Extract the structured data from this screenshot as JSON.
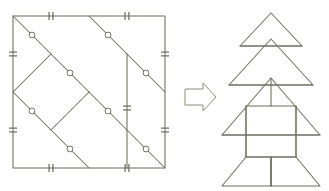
{
  "figure": {
    "caption": "",
    "background_color": "#ffffff",
    "line_color": "#6b6f5e",
    "tick_color": "#5f6353",
    "marker_fill": "#ffffff",
    "arrow_color": "#8a8d7c"
  },
  "left_shape": {
    "name": "square-dissection",
    "label": "",
    "square": {
      "x": 13,
      "y": 16,
      "width": 152,
      "height": 152
    },
    "outline_points": "13,16 165,16 165,168 13,168",
    "cut_lines": [
      {
        "name": "cut-diagonal-upper-left",
        "points": "13,16 89,92"
      },
      {
        "name": "cut-diagonal-upper-right",
        "points": "89,16 165,92"
      },
      {
        "name": "cut-diagonal-lower-left",
        "points": "13,92 89,168"
      },
      {
        "name": "cut-diagonal-lower-right",
        "points": "89,92 165,168"
      },
      {
        "name": "cut-chevron-left",
        "points": "13,92 51,54"
      },
      {
        "name": "cut-chevron-mid",
        "points": "51,130 89,92"
      },
      {
        "name": "cut-vertical-right",
        "points": "127,54 127,168"
      }
    ],
    "nodes": [
      {
        "name": "node-a",
        "x": 32,
        "y": 35
      },
      {
        "name": "node-b",
        "x": 32,
        "y": 111
      },
      {
        "name": "node-c",
        "x": 70,
        "y": 73
      },
      {
        "name": "node-d",
        "x": 70,
        "y": 149
      },
      {
        "name": "node-e",
        "x": 108,
        "y": 35
      },
      {
        "name": "node-f",
        "x": 108,
        "y": 111
      },
      {
        "name": "node-g",
        "x": 146,
        "y": 73
      },
      {
        "name": "node-h",
        "x": 146,
        "y": 149
      }
    ],
    "edge_ticks": [
      {
        "name": "tick-top-left",
        "x": 51,
        "y": 16,
        "orientation": "vertical"
      },
      {
        "name": "tick-top-right",
        "x": 127,
        "y": 16,
        "orientation": "vertical"
      },
      {
        "name": "tick-bottom-left",
        "x": 51,
        "y": 168,
        "orientation": "vertical"
      },
      {
        "name": "tick-bottom-right",
        "x": 127,
        "y": 168,
        "orientation": "vertical"
      },
      {
        "name": "tick-left-upper",
        "x": 13,
        "y": 54,
        "orientation": "horizontal"
      },
      {
        "name": "tick-left-lower",
        "x": 13,
        "y": 130,
        "orientation": "horizontal"
      },
      {
        "name": "tick-right-upper",
        "x": 165,
        "y": 54,
        "orientation": "horizontal"
      },
      {
        "name": "tick-right-lower",
        "x": 165,
        "y": 130,
        "orientation": "horizontal"
      },
      {
        "name": "tick-inner-vertical",
        "x": 127,
        "y": 108,
        "orientation": "horizontal"
      }
    ]
  },
  "arrow": {
    "name": "transform-arrow",
    "label": "",
    "direction": "right",
    "points": "185,89 203,89 203,83 216,97 203,111 203,105 185,105"
  },
  "right_shape": {
    "name": "tree-assembly",
    "label": "",
    "pieces": [
      {
        "name": "tree-tier-top",
        "points": "271,13 302,46 240,46"
      },
      {
        "name": "tree-tier-middle",
        "points": "271,39 313,85 229,85"
      },
      {
        "name": "tree-tier-bottom",
        "points": "271,78 320,135 222,135"
      },
      {
        "name": "tree-trunk",
        "points": "246,106 296,106 296,157 246,157"
      },
      {
        "name": "tree-base-left",
        "points": "246,157 222,186 271,186 271,157"
      },
      {
        "name": "tree-base-right",
        "points": "296,157 320,186 271,186 271,157"
      }
    ],
    "internal_lines": [
      {
        "name": "tree-line-tier-top-base",
        "points": "240,46 302,46"
      },
      {
        "name": "tree-line-tier-mid-base",
        "points": "229,85 313,85"
      },
      {
        "name": "tree-line-tier-bottom-base",
        "points": "222,135 320,135"
      },
      {
        "name": "tree-line-trunk-left",
        "points": "246,106 246,157"
      },
      {
        "name": "tree-line-trunk-right",
        "points": "296,106 296,157"
      },
      {
        "name": "tree-line-mid-vertical",
        "points": "271,78 271,106"
      },
      {
        "name": "tree-line-base-split",
        "points": "271,157 271,186"
      }
    ]
  }
}
